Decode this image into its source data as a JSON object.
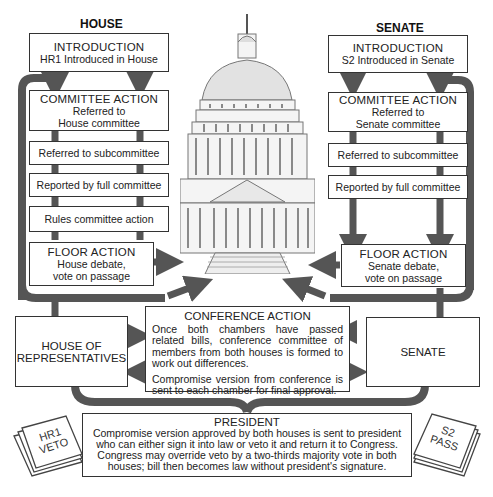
{
  "house": {
    "header": "HOUSE",
    "introduction": {
      "title": "INTRODUCTION",
      "text": "HR1 Introduced in House"
    },
    "committee": {
      "title": "COMMITTEE ACTION",
      "line1": "Referred to",
      "line2": "House committee"
    },
    "subcommittee": "Referred to subcommittee",
    "full_committee": "Reported by full committee",
    "rules": "Rules committee action",
    "floor": {
      "title": "FLOOR ACTION",
      "line1": "House debate,",
      "line2": "vote on passage"
    },
    "chamber": {
      "line1": "HOUSE OF",
      "line2": "REPRESENTATIVES"
    },
    "paper": {
      "line1": "HR1",
      "line2": "VETO"
    }
  },
  "senate": {
    "header": "SENATE",
    "introduction": {
      "title": "INTRODUCTION",
      "text": "S2 Introduced in Senate"
    },
    "committee": {
      "title": "COMMITTEE ACTION",
      "line1": "Referred to",
      "line2": "Senate committee"
    },
    "subcommittee": "Referred to subcommittee",
    "full_committee": "Reported by full committee",
    "floor": {
      "title": "FLOOR ACTION",
      "line1": "Senate debate,",
      "line2": "vote on passage"
    },
    "chamber": "SENATE",
    "paper": {
      "line1": "S2",
      "line2": "PASS"
    }
  },
  "conference": {
    "title": "CONFERENCE ACTION",
    "p1": "Once both chambers have passed related bills, conference committee of members from both houses is formed to work out differences.",
    "p2": "Compromise version from conference is sent to each chamber for final approval."
  },
  "president": {
    "title": "PRESIDENT",
    "text": "Compromise version approved by both houses is sent to president who can either sign it into law or veto it and return it to Congress. Congress may override veto by a two-thirds majority vote in both houses; bill then becomes law without president's signature."
  },
  "colors": {
    "arrow": "#555555",
    "border": "#333333",
    "capitol": "#8a8a8a"
  }
}
